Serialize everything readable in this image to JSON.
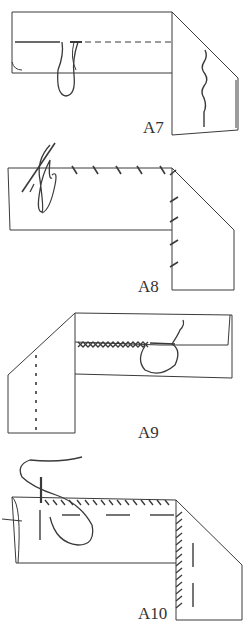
{
  "figures": [
    {
      "id": "A7",
      "label": "A7",
      "description": "Running stitch along folded hem with thread loop"
    },
    {
      "id": "A8",
      "label": "A8",
      "description": "Slanted hemming stitch along fold with needle"
    },
    {
      "id": "A9",
      "label": "A9",
      "description": "Herringbone (cross) stitch along hem with thread loop"
    },
    {
      "id": "A10",
      "label": "A10",
      "description": "Overcast stitch along edge with needle and thread"
    }
  ],
  "colors": {
    "line": "#3a3a3a",
    "background": "#ffffff"
  }
}
